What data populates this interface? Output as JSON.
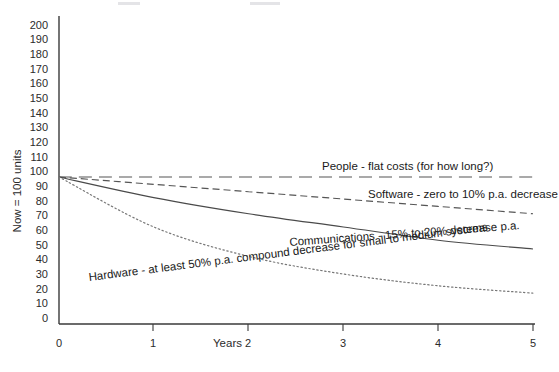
{
  "chart_data": {
    "type": "line",
    "title": "",
    "xlabel": "Years",
    "ylabel": "Now = 100 units",
    "xlim": [
      0,
      5
    ],
    "ylim": [
      0,
      200
    ],
    "grid": false,
    "legend": "inline-annotations",
    "x": [
      0,
      1,
      2,
      3,
      4,
      5
    ],
    "xticks": [
      "0",
      "1",
      "2",
      "3",
      "4",
      "5"
    ],
    "yticks": [
      "0",
      "10",
      "20",
      "30",
      "40",
      "50",
      "60",
      "70",
      "80",
      "90",
      "100",
      "110",
      "120",
      "130",
      "140",
      "150",
      "160",
      "170",
      "180",
      "190",
      "200"
    ],
    "series": [
      {
        "name": "People",
        "label": "People - flat costs (for how  long?)",
        "style": "long-dash",
        "color": "#555555",
        "values": [
          100,
          100,
          100,
          100,
          100,
          100
        ]
      },
      {
        "name": "Software",
        "label": "Software - zero to 10% p.a. decrease",
        "style": "dashed",
        "color": "#555555",
        "values": [
          100,
          95,
          90,
          85,
          80,
          75
        ]
      },
      {
        "name": "Communications",
        "label": "Communications - 15% to 20% decrease p.a.",
        "style": "solid",
        "color": "#4a4a4a",
        "values": [
          100,
          86,
          75,
          66,
          57,
          51
        ]
      },
      {
        "name": "Hardware",
        "label": "Hardware - at least 50% p.a. compound decrease for small to medium systems",
        "style": "dotted",
        "color": "#777777",
        "values": [
          100,
          66,
          46,
          34,
          26,
          21
        ]
      }
    ]
  },
  "axes": {
    "x_title": "Years",
    "y_title": "Now = 100 units"
  },
  "colors": {
    "axis": "#3a3a3a",
    "text": "#2b2b2b",
    "background": "#ffffff"
  }
}
